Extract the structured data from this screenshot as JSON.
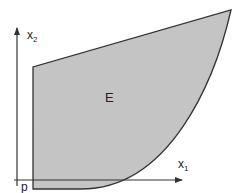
{
  "diagram": {
    "region_label": "E",
    "point_label": "p",
    "x_axis": {
      "label": "x",
      "subscript": "1"
    },
    "y_axis": {
      "label": "x",
      "subscript": "2"
    },
    "colors": {
      "region_fill": "#c4c4c4",
      "region_stroke": "#333333",
      "axis": "#333333"
    }
  }
}
